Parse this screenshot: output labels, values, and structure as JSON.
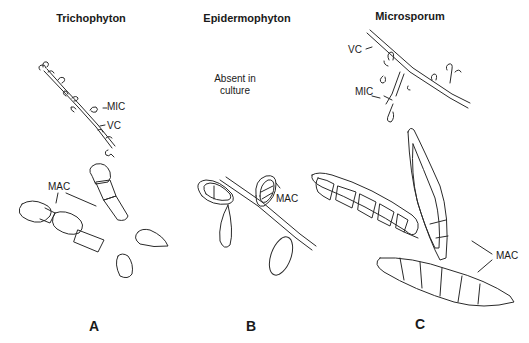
{
  "figure": {
    "panels": [
      {
        "id": "A",
        "title": "Trichophyton",
        "panel_label": "A",
        "callouts": {
          "mic": "MIC",
          "vc": "VC",
          "mac": "MAC"
        }
      },
      {
        "id": "B",
        "title": "Epidermophyton",
        "panel_label": "B",
        "note_line1": "Absent in",
        "note_line2": "culture",
        "callouts": {
          "mac": "MAC"
        }
      },
      {
        "id": "C",
        "title": "Microsporum",
        "panel_label": "C",
        "callouts": {
          "vc": "VC",
          "mic": "MIC",
          "mac": "MAC"
        }
      }
    ],
    "colors": {
      "ink": "#2a2a2a",
      "background": "#ffffff"
    }
  }
}
